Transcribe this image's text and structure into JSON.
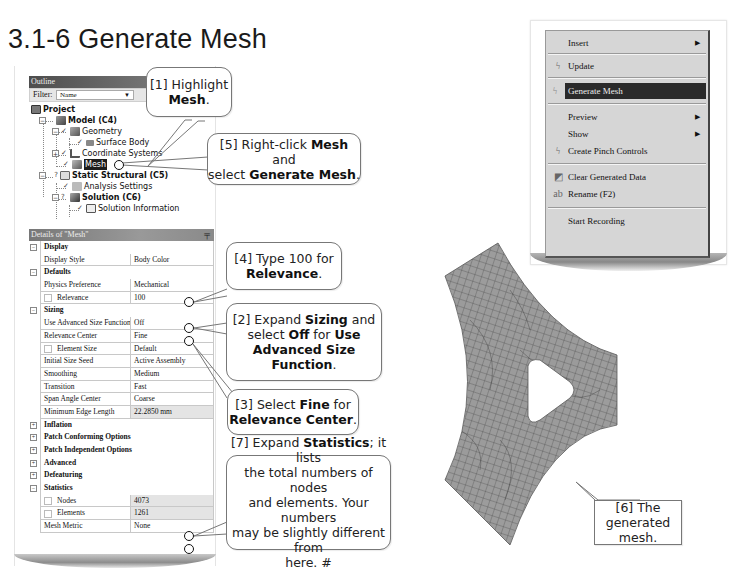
{
  "page": {
    "title": "3.1-6 Generate Mesh"
  },
  "outline": {
    "header": "Outline",
    "filter_label": "Filter:",
    "filter_value": "Name",
    "tree": [
      {
        "label": "Project",
        "bold": true,
        "icon": "project-icon"
      },
      {
        "label": "Model (C4)",
        "bold": true,
        "icon": "model-icon"
      },
      {
        "label": "Geometry",
        "bold": false,
        "icon": "geometry-icon"
      },
      {
        "label": "Surface Body",
        "bold": false,
        "icon": "surface-body-icon"
      },
      {
        "label": "Coordinate Systems",
        "bold": false,
        "icon": "coordinate-systems-icon"
      },
      {
        "label": "Mesh",
        "bold": false,
        "icon": "mesh-icon",
        "selected": true
      },
      {
        "label": "Static Structural (C5)",
        "bold": true,
        "icon": "static-structural-icon"
      },
      {
        "label": "Analysis Settings",
        "bold": false,
        "icon": "analysis-settings-icon"
      },
      {
        "label": "Solution (C6)",
        "bold": true,
        "icon": "solution-icon"
      },
      {
        "label": "Solution Information",
        "bold": false,
        "icon": "solution-information-icon"
      }
    ]
  },
  "details": {
    "header": "Details of \"Mesh\"",
    "groups": {
      "display": {
        "label": "Display",
        "rows": [
          {
            "name": "Display Style",
            "value": "Body Color"
          }
        ]
      },
      "defaults": {
        "label": "Defaults",
        "rows": [
          {
            "name": "Physics Preference",
            "value": "Mechanical"
          },
          {
            "name": "Relevance",
            "value": "100"
          }
        ]
      },
      "sizing": {
        "label": "Sizing",
        "rows": [
          {
            "name": "Use Advanced Size Function",
            "value": "Off"
          },
          {
            "name": "Relevance Center",
            "value": "Fine"
          },
          {
            "name": "Element Size",
            "value": "Default"
          },
          {
            "name": "Initial Size Seed",
            "value": "Active Assembly"
          },
          {
            "name": "Smoothing",
            "value": "Medium"
          },
          {
            "name": "Transition",
            "value": "Fast"
          },
          {
            "name": "Span Angle Center",
            "value": "Coarse"
          },
          {
            "name": "Minimum Edge Length",
            "value": "22.2850 mm"
          }
        ]
      },
      "inflation": {
        "label": "Inflation"
      },
      "patch_conforming": {
        "label": "Patch Conforming Options"
      },
      "patch_independent": {
        "label": "Patch Independent Options"
      },
      "advanced": {
        "label": "Advanced"
      },
      "defeaturing": {
        "label": "Defeaturing"
      },
      "statistics": {
        "label": "Statistics",
        "rows": [
          {
            "name": "Nodes",
            "value": "4073"
          },
          {
            "name": "Elements",
            "value": "1261"
          },
          {
            "name": "Mesh Metric",
            "value": "None"
          }
        ]
      }
    }
  },
  "callouts": {
    "c1": {
      "prefix": "[1] Highlight",
      "bold": "Mesh",
      "suffix": "."
    },
    "c5": {
      "line1_prefix": "[5] Right-click ",
      "line1_bold": "Mesh",
      "line1_suffix": " and",
      "line2_prefix": "select ",
      "line2_bold": "Generate Mesh",
      "line2_suffix": "."
    },
    "c4": {
      "line1": "[4] Type 100 for",
      "bold": "Relevance",
      "suffix": "."
    },
    "c2": {
      "p1": "[2] Expand ",
      "b1": "Sizing",
      "p2": " and",
      "p3": "select ",
      "b2": "Off",
      "p4": " for ",
      "b3": "Use",
      "b4": "Advanced Size",
      "b5": "Function",
      "p5": "."
    },
    "c3": {
      "p1": "[3] Select ",
      "b1": "Fine",
      "p2": " for",
      "b2": "Relevance Center",
      "p3": "."
    },
    "c7": {
      "p1": "[7] Expand ",
      "b1": "Statistics",
      "p2": "; it lists",
      "l2": "the total numbers of nodes",
      "l3": "and elements. Your numbers",
      "l4": "may be slightly different from",
      "l5": "here. #"
    },
    "c6": {
      "l1": "[6] The generated",
      "l2": "mesh."
    }
  },
  "context_menu": {
    "items": [
      {
        "label": "Insert",
        "icon": "",
        "submenu": true
      },
      {
        "label": "Update",
        "icon": "lightning-icon",
        "submenu": false
      },
      {
        "label": "Generate Mesh",
        "icon": "lightning-icon",
        "submenu": false,
        "highlighted": true
      },
      {
        "label": "Preview",
        "icon": "",
        "submenu": true
      },
      {
        "label": "Show",
        "icon": "",
        "submenu": true
      },
      {
        "label": "Create Pinch Controls",
        "icon": "lightning-icon",
        "submenu": false
      },
      {
        "label": "Clear Generated Data",
        "icon": "clear-data-icon",
        "submenu": false
      },
      {
        "label": "Rename (F2)",
        "icon": "rename-icon",
        "submenu": false
      },
      {
        "label": "Start Recording",
        "icon": "",
        "submenu": false
      }
    ]
  },
  "colors": {
    "mesh_fill": "#9a9a9a",
    "mesh_line": "#3a3a3a",
    "menu_bg": "#d6d6d6",
    "menu_highlight": "#2a2a2a",
    "header_bar": "#5a5a5a"
  }
}
